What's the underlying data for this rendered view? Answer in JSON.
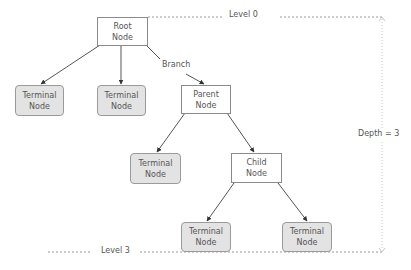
{
  "diagram": {
    "type": "tree",
    "colors": {
      "edge": "#555555",
      "internal_fill": "#ffffff",
      "terminal_fill": "#e3e3e3",
      "border": "#8a8a8a",
      "guide": "#9a9a9a",
      "text": "#555555"
    },
    "nodes": {
      "root": {
        "line1": "Root",
        "line2": "Node"
      },
      "terminal_a": {
        "line1": "Terminal",
        "line2": "Node"
      },
      "terminal_b": {
        "line1": "Terminal",
        "line2": "Node"
      },
      "parent": {
        "line1": "Parent",
        "line2": "Node"
      },
      "terminal_c": {
        "line1": "Terminal",
        "line2": "Node"
      },
      "child": {
        "line1": "Child",
        "line2": "Node"
      },
      "terminal_d": {
        "line1": "Terminal",
        "line2": "Node"
      },
      "terminal_e": {
        "line1": "Terminal",
        "line2": "Node"
      }
    },
    "edges": [
      {
        "from": "root",
        "to": "terminal_a"
      },
      {
        "from": "root",
        "to": "terminal_b"
      },
      {
        "from": "root",
        "to": "parent",
        "label": "Branch"
      },
      {
        "from": "parent",
        "to": "terminal_c"
      },
      {
        "from": "parent",
        "to": "child"
      },
      {
        "from": "child",
        "to": "terminal_d"
      },
      {
        "from": "child",
        "to": "terminal_e"
      }
    ],
    "annotations": {
      "branch_label": "Branch",
      "level_top": "Level 0",
      "level_bottom": "Level 3",
      "depth": "Depth = 3"
    }
  }
}
